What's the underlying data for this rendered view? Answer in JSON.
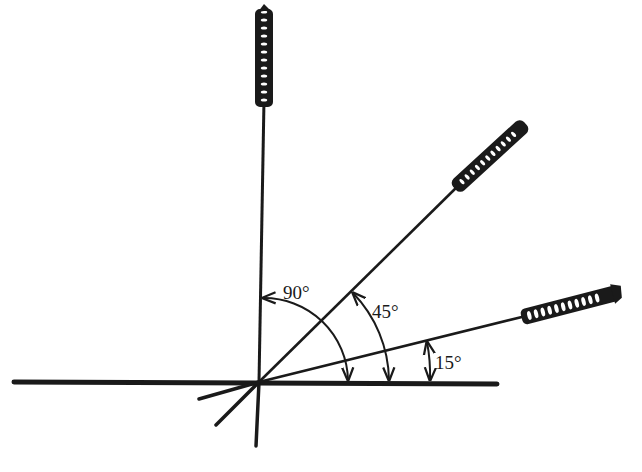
{
  "diagram": {
    "type": "angle-orientation-diagram",
    "origin": {
      "x": 259,
      "y": 382
    },
    "colors": {
      "ink": "#1a1a1a",
      "background": "#ffffff"
    },
    "baseline": {
      "x1": 14,
      "y1": 382,
      "x2": 497,
      "y2": 384
    },
    "rods": [
      {
        "id": "rod-90",
        "angle_deg": 90,
        "label": "90°",
        "line": {
          "x1": 259,
          "y1": 382,
          "x2": 264,
          "y2": 100
        },
        "coil": {
          "x1": 264,
          "y1": 104,
          "x2": 264,
          "y2": 8
        },
        "tail": {
          "x1": 259,
          "y1": 382,
          "x2": 256,
          "y2": 446
        }
      },
      {
        "id": "rod-45",
        "angle_deg": 45,
        "label": "45°",
        "line": {
          "x1": 259,
          "y1": 382,
          "x2": 458,
          "y2": 186
        },
        "coil": {
          "x1": 456,
          "y1": 188,
          "x2": 524,
          "y2": 124
        },
        "tail": {
          "x1": 259,
          "y1": 382,
          "x2": 216,
          "y2": 425
        }
      },
      {
        "id": "rod-15",
        "angle_deg": 15,
        "label": "15°",
        "line": {
          "x1": 259,
          "y1": 382,
          "x2": 525,
          "y2": 316
        },
        "coil": {
          "x1": 522,
          "y1": 316,
          "x2": 620,
          "y2": 292
        },
        "tail": {
          "x1": 259,
          "y1": 382,
          "x2": 199,
          "y2": 399
        }
      }
    ],
    "angle_arcs": [
      {
        "id": "arc-90",
        "label": "90°",
        "label_pos": {
          "x": 283,
          "y": 299
        }
      },
      {
        "id": "arc-45",
        "label": "45°",
        "label_pos": {
          "x": 372,
          "y": 318
        }
      },
      {
        "id": "arc-15",
        "label": "15°",
        "label_pos": {
          "x": 435,
          "y": 369
        }
      }
    ]
  }
}
